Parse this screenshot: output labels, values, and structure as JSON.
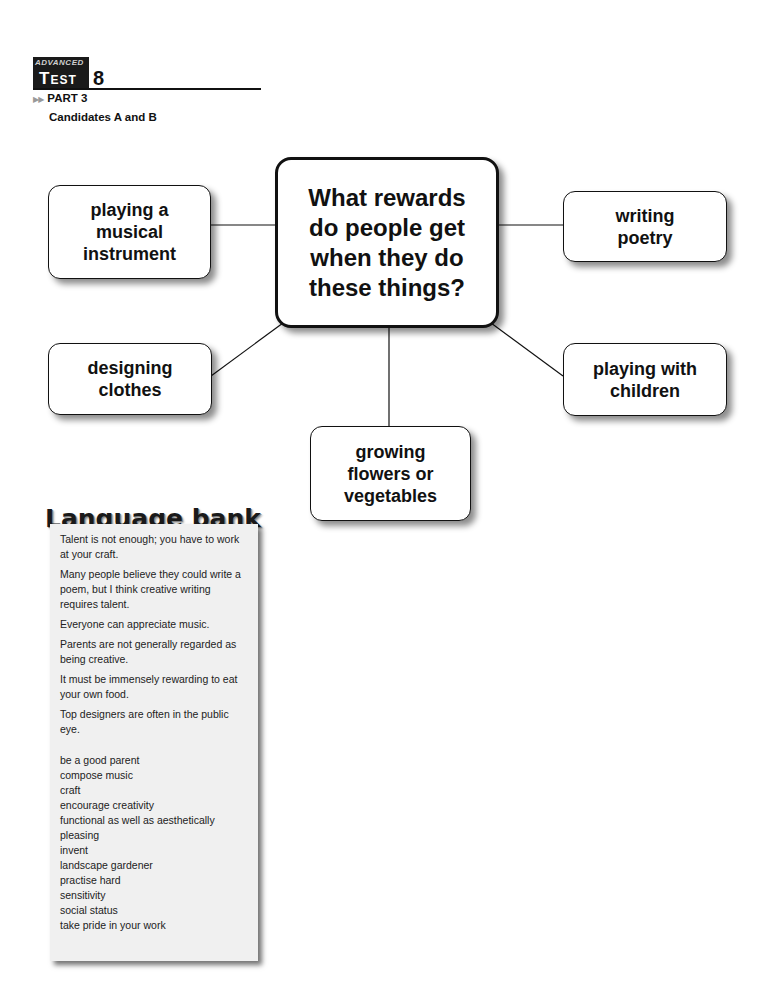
{
  "header": {
    "level": "ADVANCED",
    "test_word": "Test",
    "test_number": "8",
    "part": "PART 3",
    "candidates": "Candidates A and B"
  },
  "diagram": {
    "center": "What rewards do people get when they do these things?",
    "nodes": [
      {
        "id": "music",
        "label": "playing a musical instrument"
      },
      {
        "id": "poetry",
        "label": "writing poetry"
      },
      {
        "id": "clothes",
        "label": "designing clothes"
      },
      {
        "id": "children",
        "label": "playing with children"
      },
      {
        "id": "garden",
        "label": "growing flowers or vegetables"
      }
    ]
  },
  "language_bank": {
    "title": "Language bank",
    "sentences": [
      "Talent is not enough; you have to work at your craft.",
      "Many people believe they could write a poem, but I think creative writing requires talent.",
      "Everyone can appreciate music.",
      "Parents are not generally regarded as being creative.",
      "It must be immensely rewarding to eat your own food.",
      "Top designers are often in the public eye."
    ],
    "words": [
      "be a good parent",
      "compose music",
      "craft",
      "encourage creativity",
      "functional as well as aesthetically pleasing",
      "invent",
      "landscape gardener",
      "practise hard",
      "sensitivity",
      "social status",
      "take pride in your work"
    ]
  }
}
